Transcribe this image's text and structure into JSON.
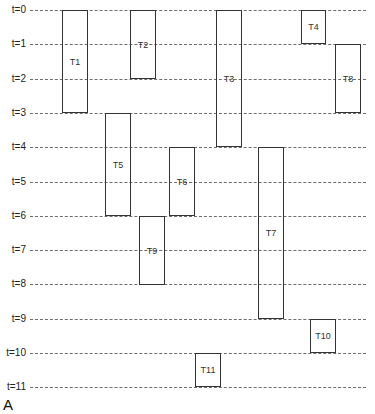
{
  "panel_label": "A",
  "layout": {
    "row_origin_y": 10,
    "row_spacing": 34.3,
    "line_x_start": 30,
    "line_x_end": 366
  },
  "time_axis": {
    "labels": [
      "t=0",
      "t=1",
      "t=2",
      "t=3",
      "t=4",
      "t=5",
      "t=6",
      "t=7",
      "t=8",
      "t=9",
      "t=10",
      "t=11"
    ]
  },
  "tasks": [
    {
      "name": "T1",
      "start": 0,
      "end": 3,
      "x": 62,
      "w": 26
    },
    {
      "name": "T2",
      "start": 0,
      "end": 2,
      "x": 130,
      "w": 26
    },
    {
      "name": "T3",
      "start": 0,
      "end": 4,
      "x": 216,
      "w": 26
    },
    {
      "name": "T4",
      "start": 0,
      "end": 1,
      "x": 301,
      "w": 25
    },
    {
      "name": "T5",
      "start": 3,
      "end": 6,
      "x": 105,
      "w": 26
    },
    {
      "name": "T6",
      "start": 4,
      "end": 6,
      "x": 169,
      "w": 26
    },
    {
      "name": "T7",
      "start": 4,
      "end": 9,
      "x": 258,
      "w": 26
    },
    {
      "name": "T8",
      "start": 1,
      "end": 3,
      "x": 335,
      "w": 26
    },
    {
      "name": "T9",
      "start": 6,
      "end": 8,
      "x": 139,
      "w": 26
    },
    {
      "name": "T10",
      "start": 9,
      "end": 10,
      "x": 310,
      "w": 26
    },
    {
      "name": "T11",
      "start": 10,
      "end": 11,
      "x": 195,
      "w": 26
    }
  ]
}
